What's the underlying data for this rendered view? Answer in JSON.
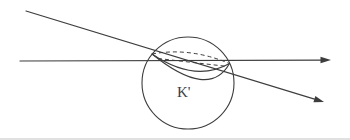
{
  "diagram": {
    "label": "K'",
    "dash_pattern": "4 3",
    "colors": {
      "ink": "#3d3d3d",
      "background": "#ffffff",
      "edge": "#d7d7d7"
    },
    "paths": {
      "sphere_circle": "M 142,83 a 46,46 0 1 0 92,0 a 46,46 0 1 0 -92,0 Z",
      "rim_back_dashed": "M 152,54 Q 190,47 229.5,63.5",
      "chord_dashed": "M 158,58.5 L 228,66.5",
      "rim_front_arc": "M 152,54 Q 195,83 229.5,63.5",
      "cap_bottom_arc": "M 152,54 Q 209,100 229.5,63.5",
      "horizontal_ray": "M 20,61 L 321.5,60.1",
      "horizontal_arrowhead": "M 331,60 L 320.5,56.8 L 320.5,63.2 Z",
      "oblique_ray": "M 26,11 L 314.5,99.1",
      "oblique_arrowhead": "M 324,102 L 313.4,102.2 L 315.4,95.9 Z",
      "scan_edge": "M 0,139 L 350,139"
    }
  }
}
